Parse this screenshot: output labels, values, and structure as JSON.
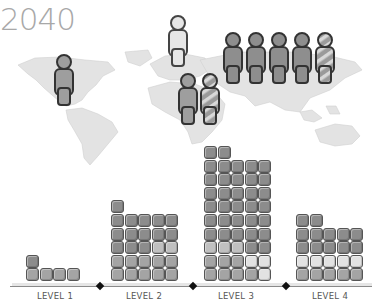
{
  "title": {
    "year": "2040"
  },
  "colors": {
    "dark": "#8c8c8c",
    "mid": "#a4a4a4",
    "light": "#c0c0c0",
    "pale": "#e2e2e2",
    "map": "#e3e3e3",
    "outline": "#444444",
    "text": "#555555"
  },
  "map": {
    "people": [
      {
        "region": "north-america",
        "x": 54,
        "y": 54,
        "style": "mid"
      },
      {
        "region": "europe",
        "x": 168,
        "y": 15,
        "style": "pale"
      },
      {
        "region": "africa",
        "x": 178,
        "y": 73,
        "style": "mid"
      },
      {
        "region": "africa",
        "x": 200,
        "y": 73,
        "style": "striped"
      },
      {
        "region": "asia",
        "x": 223,
        "y": 32,
        "style": "dark"
      },
      {
        "region": "asia",
        "x": 246,
        "y": 32,
        "style": "dark"
      },
      {
        "region": "asia",
        "x": 269,
        "y": 32,
        "style": "dark"
      },
      {
        "region": "asia",
        "x": 292,
        "y": 32,
        "style": "dark"
      },
      {
        "region": "asia",
        "x": 315,
        "y": 32,
        "style": "striped"
      }
    ]
  },
  "chart_data": {
    "type": "bar",
    "title": "2040",
    "categories": [
      "LEVEL 1",
      "LEVEL 2",
      "LEVEL 3",
      "LEVEL 4"
    ],
    "values": [
      5,
      26,
      42,
      22
    ],
    "unit": "blocks (stacked pictogram, columns of 5)",
    "columns": [
      {
        "label": "LEVEL 1",
        "x": 26,
        "heights": [
          2,
          1,
          1,
          1
        ],
        "rows_from_bottom": [
          [
            "mid",
            "mid",
            "mid",
            "mid"
          ],
          [
            "dark"
          ]
        ]
      },
      {
        "label": "LEVEL 2",
        "x": 111,
        "heights": [
          6,
          5,
          5,
          5,
          5
        ]
      },
      {
        "label": "LEVEL 3",
        "x": 204,
        "heights": [
          10,
          10,
          9,
          9,
          9
        ]
      },
      {
        "label": "LEVEL 4",
        "x": 296,
        "heights": [
          5,
          5,
          4,
          4,
          4
        ]
      }
    ],
    "xlabel": "",
    "ylabel": "",
    "grid": false,
    "legend": null
  },
  "labels": {
    "l1": "LEVEL 1",
    "l2": "LEVEL 2",
    "l3": "LEVEL 3",
    "l4": "LEVEL 4"
  }
}
